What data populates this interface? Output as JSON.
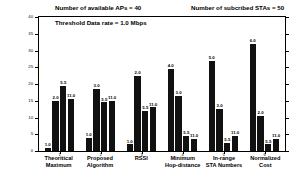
{
  "chart_data": {
    "type": "bar",
    "title": "",
    "xlabel": "",
    "ylabel": "Number of covered STAs",
    "ylim": [
      0,
      40
    ],
    "yticks": [
      0,
      5,
      10,
      15,
      20,
      25,
      30,
      35,
      40
    ],
    "ytick_labels": [
      "0",
      "5",
      "10",
      "15",
      "20",
      "25",
      "30",
      "35",
      "40"
    ],
    "grid": false,
    "legend": "none",
    "categories": [
      "Theoritical\nMaximum",
      "Proposed\nAlgorithm",
      "RSSI",
      "Minimum\nHop-distance",
      "In-range\nSTA Numbers",
      "Normalized\nCost"
    ],
    "xtick_numbers": [
      "1",
      "2",
      "3",
      "4",
      "5",
      "6"
    ],
    "series": [
      {
        "name": "bar1",
        "values": [
          1.0,
          4.0,
          2.0,
          24.5,
          27.0,
          32.0
        ],
        "labels": [
          "1.0",
          "1.0",
          "1.0",
          "4.0",
          "5.0",
          "6.0"
        ]
      },
      {
        "name": "bar2",
        "values": [
          15.0,
          18.5,
          22.5,
          16.5,
          12.5,
          10.5
        ],
        "labels": [
          "2.0",
          "3.0",
          "2.0",
          "3.0",
          "3.0",
          "2.0"
        ]
      },
      {
        "name": "bar3",
        "values": [
          19.5,
          14.5,
          12.0,
          4.5,
          2.5,
          2.0
        ],
        "labels": [
          "5.5",
          "5.5",
          "5.5",
          "5.5",
          "5.5",
          "5.5"
        ]
      },
      {
        "name": "bar4",
        "values": [
          15.5,
          15.0,
          13.0,
          3.5,
          4.5,
          3.5
        ],
        "labels": [
          "11.0",
          "11.0",
          "11.0",
          "11.0",
          "11.0",
          "11.0"
        ]
      }
    ]
  },
  "annotations": {
    "available_aps": "Number of available APs = 40",
    "subscribed_stas": "Number of subcribed STAs = 50",
    "threshold": "Threshold Data rate = 1.0 Mbps"
  }
}
